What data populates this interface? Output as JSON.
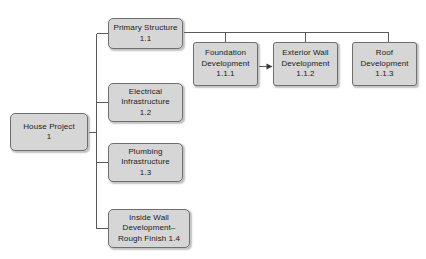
{
  "diagram": {
    "background_color": "#ffffff",
    "node_fill_color": "#d6d6d6",
    "node_border_color": "#6f6f6f",
    "connector_color": "#5a5a5a",
    "root": {
      "id": "1",
      "name": "house-project",
      "line1": "House Project",
      "line2": "1"
    },
    "level2": [
      {
        "id": "1.1",
        "name": "primary-structure",
        "line1": "Primary Structure",
        "line2": "1.1",
        "line3": ""
      },
      {
        "id": "1.2",
        "name": "electrical-infrastructure",
        "line1": "Electrical",
        "line2": "Infrastructure",
        "line3": "1.2"
      },
      {
        "id": "1.3",
        "name": "plumbing-infrastructure",
        "line1": "Plumbing",
        "line2": "Infrastructure",
        "line3": "1.3"
      },
      {
        "id": "1.4",
        "name": "inside-wall-development",
        "line1": "Inside Wall",
        "line2": "Development–",
        "line3": "Rough Finish 1.4"
      }
    ],
    "level3": [
      {
        "id": "1.1.1",
        "name": "foundation-development",
        "line1": "Foundation",
        "line2": "Development",
        "line3": "1.1.1"
      },
      {
        "id": "1.1.2",
        "name": "exterior-wall-development",
        "line1": "Exterior Wall",
        "line2": "Development",
        "line3": "1.1.2"
      },
      {
        "id": "1.1.3",
        "name": "roof-development",
        "line1": "Roof",
        "line2": "Development",
        "line3": "1.1.3"
      }
    ],
    "sequence_arrow": {
      "name": "foundation-to-exterior-wall-arrow",
      "from": "1.1.1",
      "to": "1.1.2"
    }
  }
}
